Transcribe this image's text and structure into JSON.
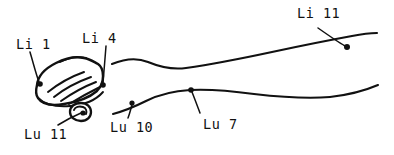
{
  "figure": {
    "background_color": "#ffffff",
    "ink_color": "#111111",
    "width": 394,
    "height": 155
  },
  "points": [
    {
      "id": "li-1",
      "label": "Li 1",
      "meridian": "Large Intestine",
      "number": 1,
      "label_x": 16,
      "label_y": 38,
      "dot_x": 40,
      "dot_y": 84,
      "leader_path": "M 30 52 C 33 62, 36 74, 39 82"
    },
    {
      "id": "li-4",
      "label": "Li 4",
      "meridian": "Large Intestine",
      "number": 4,
      "label_x": 82,
      "label_y": 32,
      "dot_x": 103,
      "dot_y": 85,
      "leader_path": "M 106 46 C 105 58, 104 72, 103 83"
    },
    {
      "id": "li-11",
      "label": "Li 11",
      "meridian": "Large Intestine",
      "number": 11,
      "label_x": 297,
      "label_y": 7,
      "dot_x": 347,
      "dot_y": 47,
      "leader_path": "M 318 28 C 328 35, 338 42, 345 46"
    },
    {
      "id": "lu-11",
      "label": "Lu 11",
      "meridian": "Lung",
      "number": 11,
      "label_x": 24,
      "label_y": 128,
      "dot_x": 83,
      "dot_y": 113,
      "leader_path": "M 58 125 C 66 120, 74 116, 81 113"
    },
    {
      "id": "lu-10",
      "label": "Lu 10",
      "meridian": "Lung",
      "number": 10,
      "label_x": 110,
      "label_y": 121,
      "dot_x": 132,
      "dot_y": 103,
      "leader_path": "M 128 118 C 130 113, 131 108, 132 105"
    },
    {
      "id": "lu-7",
      "label": "Lu 7",
      "meridian": "Lung",
      "number": 7,
      "label_x": 203,
      "label_y": 118,
      "dot_x": 191,
      "dot_y": 90,
      "leader_path": "M 200 113 C 197 105, 194 97, 192 92"
    }
  ],
  "anatomy": {
    "upper_arm_contour": "M 112 64 C 124 59, 136 57, 148 62 C 160 67, 172 70, 186 68 C 214 64, 244 58, 272 52 C 300 46, 330 40, 352 36 C 362 34, 370 33, 377 33",
    "lower_arm_contour": "M 113 114 C 124 111, 134 107, 146 101 C 158 95, 172 91, 190 90 C 210 89, 232 91, 254 94 C 280 97, 308 99, 330 97 C 348 95, 364 91, 378 85",
    "hand_outline": "M 37 85 C 38 75, 46 68, 56 63 C 66 58, 76 56, 84 58 C 90 59, 94 62, 98 64 C 101 66, 103 70, 103 76 C 103 82, 101 87, 97 91 C 90 97, 78 102, 64 104 C 52 106, 42 104, 38 98 C 35 94, 36 89, 37 85 Z",
    "hand_lower_edge": "M 38 98 C 44 104, 56 107, 70 106 C 84 105, 96 100, 103 92",
    "knuckle_ridge": "M 60 62 C 68 58, 78 56, 86 58",
    "finger_strokes": [
      "M 48 92 C 58 84, 70 77, 84 72",
      "M 54 97 C 64 89, 77 82, 91 77",
      "M 61 101 C 71 94, 83 87, 96 82",
      "M 69 104 C 79 98, 90 92, 100 87"
    ],
    "thumb_outline": "M 70 112 C 70 106, 75 103, 81 103 C 87 103, 91 107, 91 112 C 91 117, 87 121, 81 121 C 75 121, 70 117, 70 112 Z",
    "thumb_inner": "M 74 110 C 75 107, 79 106, 83 107 C 86 108, 87 111, 86 114"
  }
}
